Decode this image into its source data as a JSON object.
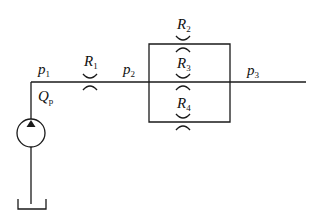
{
  "diagram": {
    "title": "",
    "type": "hydraulic-circuit",
    "labels": {
      "p1": {
        "main": "p",
        "sub": "1"
      },
      "p2": {
        "main": "p",
        "sub": "2"
      },
      "p3": {
        "main": "p",
        "sub": "3"
      },
      "qp": {
        "main": "Q",
        "sub": "p"
      },
      "r1": {
        "main": "R",
        "sub": "1"
      },
      "r2": {
        "main": "R",
        "sub": "2"
      },
      "r3": {
        "main": "R",
        "sub": "3"
      },
      "r4": {
        "main": "R",
        "sub": "4"
      }
    },
    "components": [
      {
        "id": "pump",
        "kind": "hydraulic-pump"
      },
      {
        "id": "tank",
        "kind": "reservoir"
      },
      {
        "id": "R1",
        "kind": "orifice",
        "connection": "series"
      },
      {
        "id": "R2",
        "kind": "orifice",
        "connection": "parallel"
      },
      {
        "id": "R3",
        "kind": "orifice",
        "connection": "parallel"
      },
      {
        "id": "R4",
        "kind": "orifice",
        "connection": "parallel"
      }
    ]
  }
}
